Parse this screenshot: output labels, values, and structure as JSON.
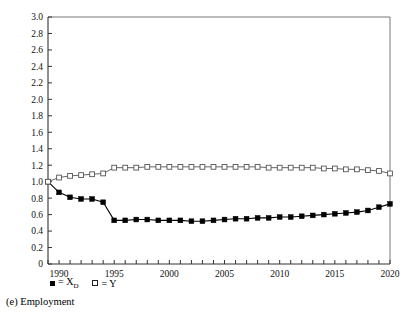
{
  "chart_data": {
    "type": "line",
    "title": "",
    "caption": "(e) Employment",
    "xlabel": "",
    "ylabel": "",
    "xlim": [
      1989,
      2020
    ],
    "ylim": [
      0,
      3.0
    ],
    "grid": false,
    "legend_position": "below-axis-left",
    "y_ticks": [
      "0",
      "0.2",
      "0.4",
      "0.6",
      "0.8",
      "1.0",
      "1.2",
      "1.4",
      "1.6",
      "1.8",
      "2.0",
      "2.2",
      "2.4",
      "2.6",
      "2.8",
      "3.0"
    ],
    "y_tick_values": [
      0,
      0.2,
      0.4,
      0.6,
      0.8,
      1.0,
      1.2,
      1.4,
      1.6,
      1.8,
      2.0,
      2.2,
      2.4,
      2.6,
      2.8,
      3.0
    ],
    "x_tick_labels": [
      "1990",
      "1995",
      "2000",
      "2005",
      "2010",
      "2015",
      "2020"
    ],
    "x_tick_label_values": [
      1990,
      1995,
      2000,
      2005,
      2010,
      2015,
      2020
    ],
    "x_minor_ticks": [
      1989,
      1990,
      1991,
      1992,
      1993,
      1994,
      1995,
      1996,
      1997,
      1998,
      1999,
      2000,
      2001,
      2002,
      2003,
      2004,
      2005,
      2006,
      2007,
      2008,
      2009,
      2010,
      2011,
      2012,
      2013,
      2014,
      2015,
      2016,
      2017,
      2018,
      2019,
      2020
    ],
    "x": [
      1989,
      1990,
      1991,
      1992,
      1993,
      1994,
      1995,
      1996,
      1997,
      1998,
      1999,
      2000,
      2001,
      2002,
      2003,
      2004,
      2005,
      2006,
      2007,
      2008,
      2009,
      2010,
      2011,
      2012,
      2013,
      2014,
      2015,
      2016,
      2017,
      2018,
      2019,
      2020
    ],
    "series": [
      {
        "name": "X_D",
        "legend_label": "= X",
        "legend_sub": "D",
        "marker": "filled-square",
        "color": "#000000",
        "values": [
          1.0,
          0.87,
          0.81,
          0.79,
          0.79,
          0.75,
          0.53,
          0.53,
          0.54,
          0.54,
          0.53,
          0.53,
          0.53,
          0.52,
          0.52,
          0.53,
          0.54,
          0.55,
          0.55,
          0.56,
          0.56,
          0.57,
          0.57,
          0.58,
          0.59,
          0.6,
          0.61,
          0.62,
          0.63,
          0.65,
          0.69,
          0.73
        ]
      },
      {
        "name": "Y",
        "legend_label": "= Y",
        "legend_sub": "",
        "marker": "open-square",
        "color": "#555555",
        "values": [
          1.0,
          1.05,
          1.07,
          1.08,
          1.09,
          1.1,
          1.17,
          1.17,
          1.17,
          1.18,
          1.18,
          1.18,
          1.18,
          1.18,
          1.18,
          1.18,
          1.18,
          1.18,
          1.18,
          1.18,
          1.17,
          1.17,
          1.17,
          1.17,
          1.17,
          1.16,
          1.16,
          1.15,
          1.15,
          1.14,
          1.13,
          1.1
        ]
      }
    ]
  }
}
